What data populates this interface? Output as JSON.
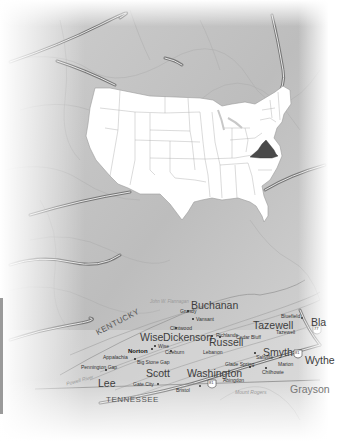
{
  "image": {
    "subject": "Map locating Virginia within the United States, over a relief map of southwest Virginia counties",
    "colors": {
      "background": "#ffffff",
      "terrain": "#c4c4c4",
      "us_states_fill": "#ffffff",
      "highlight_state_fill": "#4a4a4a",
      "roads": "#8a8a8a",
      "label_text": "#3a3a3a"
    }
  },
  "inset_map": {
    "title": "Contiguous United States",
    "highlighted_state": "Virginia"
  },
  "state_labels": {
    "kentucky": "KENTUCKY",
    "tennessee": "TENNESSEE"
  },
  "counties": {
    "buchanan": "Buchanan",
    "wise": "Wise",
    "dickenson": "Dickenson",
    "russell": "Russell",
    "tazewell": "Tazewell",
    "smyth": "Smyth",
    "wythe": "Wythe",
    "scott": "Scott",
    "lee": "Lee",
    "washington": "Washington",
    "grayson": "Grayson",
    "bland_partial": "Bla"
  },
  "cities": {
    "grundy": "Grundy",
    "vansant": "Vansant",
    "clintwood": "Clintwood",
    "coeburn": "Coeburn",
    "wise_town": "Wise",
    "norton": "Norton",
    "appalachia": "Appalachia",
    "big_stone_gap": "Big Stone Gap",
    "pennington_gap": "Pennington Gap",
    "gate_city": "Gate City",
    "lebanon": "Lebanon",
    "richlands": "Richlands",
    "cedar_bluff": "Cedar Bluff",
    "bluefield": "Bluefield",
    "tazewell_town": "Tazewell",
    "saltville": "Saltville",
    "glade_spring": "Glade Spring",
    "marion": "Marion",
    "chilhowie": "Chilhowie",
    "abingdon": "Abingdon",
    "bristol": "Bristol"
  },
  "features": {
    "john_flannagan": "John W. Flannagan",
    "powell_river": "Powell River",
    "mount_rogers": "Mount Rogers"
  },
  "interstates": {
    "i81": "81",
    "i77": "77"
  }
}
